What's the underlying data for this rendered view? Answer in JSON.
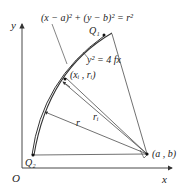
{
  "diagram": {
    "axes": {
      "x_label": "x",
      "y_label": "y",
      "origin_label": "O"
    },
    "equations": {
      "circle": "(x − a)² + (y − b)² = r²",
      "parabola": "y² = 4 fx"
    },
    "points": {
      "q1": "Q₁",
      "q2": "Q₂",
      "xi_ri": "(xᵢ , rᵢ)",
      "center": "(a , b)"
    },
    "lengths": {
      "r": "r",
      "ri": "rᵢ"
    },
    "colors": {
      "line": "#333333",
      "background": "#ffffff"
    }
  }
}
